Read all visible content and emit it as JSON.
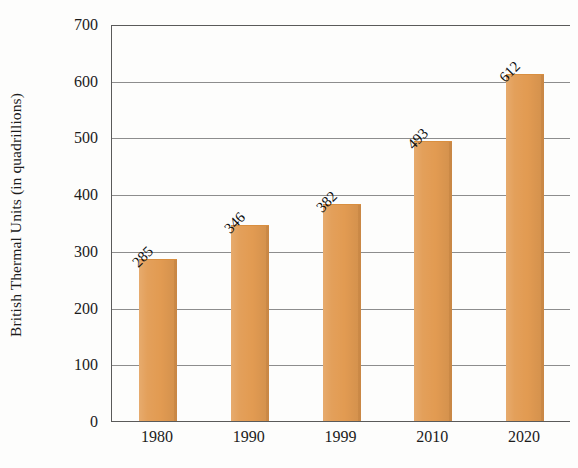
{
  "chart_data": {
    "type": "bar",
    "title": "",
    "xlabel": "",
    "ylabel": "British Thermal Units (in quadrillions)",
    "categories": [
      "1980",
      "1990",
      "1999",
      "2010",
      "2020"
    ],
    "values": [
      285,
      346,
      382,
      493,
      612
    ],
    "value_labels": [
      "285",
      "346",
      "382",
      "493",
      "612"
    ],
    "ylim": [
      0,
      700
    ],
    "yticks": [
      0,
      100,
      200,
      300,
      400,
      500,
      600,
      700
    ],
    "ytick_labels": [
      "0",
      "100",
      "200",
      "300",
      "400",
      "500",
      "600",
      "700"
    ],
    "grid": "horizontal",
    "legend": "none",
    "series": [
      {
        "name": "Energy consumption",
        "values": [
          285,
          346,
          382,
          493,
          612
        ]
      }
    ],
    "colors": {
      "bar": "#E29B52",
      "bar_edge": "#D98F40",
      "gridline": "#8D8D8D",
      "axis": "#5A5A5A",
      "text": "#1B1B1B",
      "background": "#FDFDFC"
    }
  }
}
